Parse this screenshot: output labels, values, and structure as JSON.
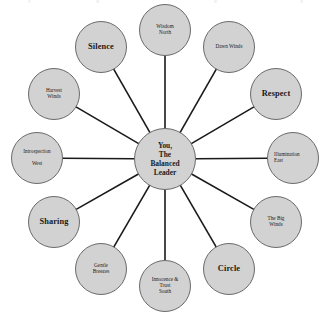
{
  "diagram": {
    "type": "hub-and-spoke-wheel",
    "title": "",
    "colors": {
      "node_fill": "#d2d2d2",
      "node_border": "#6a6a6a",
      "spoke_line": "#1a1a1a",
      "text": "#1a1a1a",
      "background": "#ffffff"
    },
    "center": {
      "label": "You,\nThe\nBalanced\nLeader",
      "x": 165,
      "y": 159,
      "radius": 31
    },
    "nodes": [
      {
        "id": "wisdom-north",
        "label": "Wisdom\nNorth",
        "bold": false,
        "align": "center",
        "x": 165,
        "y": 30,
        "radius": 26
      },
      {
        "id": "dawn-winds",
        "label": "Dawn Winds",
        "bold": false,
        "align": "center",
        "x": 229,
        "y": 47,
        "radius": 26
      },
      {
        "id": "respect",
        "label": "Respect",
        "bold": true,
        "align": "center",
        "x": 276,
        "y": 94,
        "radius": 26
      },
      {
        "id": "illumination-east",
        "label": "Illumination\nEast",
        "bold": false,
        "align": "left",
        "x": 293,
        "y": 158,
        "radius": 26
      },
      {
        "id": "the-big-winds",
        "label": "The Big\nWinds",
        "bold": false,
        "align": "center",
        "x": 276,
        "y": 222,
        "radius": 26
      },
      {
        "id": "circle",
        "label": "Circle",
        "bold": true,
        "align": "center",
        "x": 229,
        "y": 269,
        "radius": 26
      },
      {
        "id": "innocence-trust-south",
        "label": "Innocence &\nTrust\nSouth",
        "bold": false,
        "align": "center",
        "x": 165,
        "y": 286,
        "radius": 26
      },
      {
        "id": "gentle-breezes",
        "label": "Gentle\nBreezes",
        "bold": false,
        "align": "center",
        "x": 101,
        "y": 269,
        "radius": 26
      },
      {
        "id": "sharing",
        "label": "Sharing",
        "bold": true,
        "align": "center",
        "x": 54,
        "y": 222,
        "radius": 26
      },
      {
        "id": "introspection-west",
        "label": "Introspection\n\nWest",
        "bold": false,
        "align": "center",
        "x": 37,
        "y": 158,
        "radius": 26
      },
      {
        "id": "harvest-winds",
        "label": "Harvest\nWinds",
        "bold": false,
        "align": "center",
        "x": 54,
        "y": 94,
        "radius": 26
      },
      {
        "id": "silence",
        "label": "Silence",
        "bold": true,
        "align": "center",
        "x": 101,
        "y": 47,
        "radius": 26
      }
    ]
  }
}
